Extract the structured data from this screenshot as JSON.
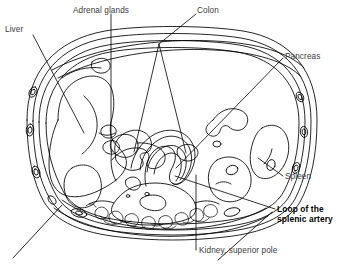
{
  "figure": {
    "type": "anatomical-line-drawing",
    "background_color": "#ffffff",
    "line_color": "#000000",
    "label_color": "#3a3a3a",
    "emphasis_color": "#000000"
  },
  "labels": {
    "liver": "Liver",
    "adrenal_glands": "Adrenal glands",
    "colon": "Colon",
    "pancreas": "Pancreas",
    "spleen": "Spleen",
    "loop_line1": "Loop of the",
    "loop_line2": "splenic artery",
    "kidney": "Kidney, superior pole"
  }
}
